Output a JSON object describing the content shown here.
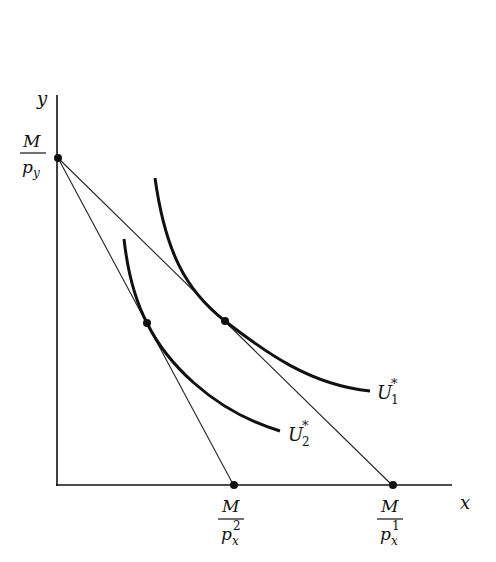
{
  "diagram": {
    "type": "consumer-choice-indifference-curves",
    "axes": {
      "x_label": "x",
      "y_label": "y"
    },
    "intercepts": {
      "y_intercept": {
        "num": "M",
        "den_base": "p",
        "den_sub": "y",
        "den_sup": ""
      },
      "x_intercept_2": {
        "num": "M",
        "den_base": "p",
        "den_sub": "x",
        "den_sup": "2"
      },
      "x_intercept_1": {
        "num": "M",
        "den_base": "p",
        "den_sub": "x",
        "den_sup": "1"
      }
    },
    "curves": [
      {
        "name": "U1",
        "label_base": "U",
        "label_sub": "1",
        "label_sup": "*"
      },
      {
        "name": "U2",
        "label_base": "U",
        "label_sub": "2",
        "label_sup": "*"
      }
    ],
    "budget_lines": [
      {
        "from": "y_intercept",
        "to": "x_intercept_1"
      },
      {
        "from": "y_intercept",
        "to": "x_intercept_2"
      }
    ],
    "colors": {
      "ink": "#111111",
      "background": "#ffffff"
    }
  }
}
